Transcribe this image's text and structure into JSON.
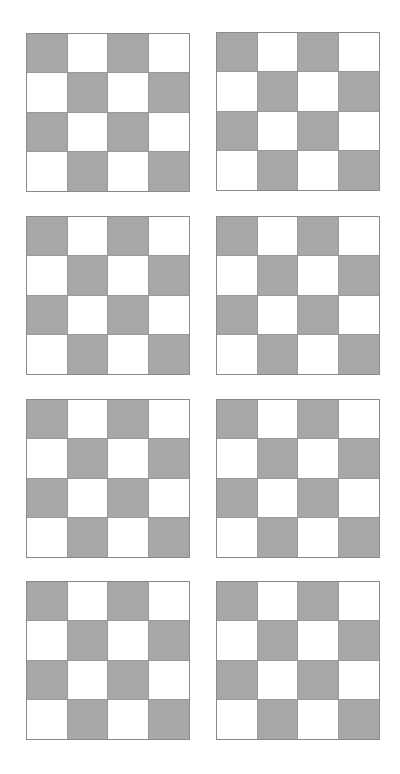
{
  "figure": {
    "colors": {
      "dark_cell": "#a7a7a7",
      "light_cell": "#ffffff",
      "grid_line": "#8a8a8a",
      "background": "#ffffff"
    },
    "grid_size": {
      "rows": 4,
      "cols": 4
    },
    "pattern": [
      [
        "dark",
        "light",
        "dark",
        "light"
      ],
      [
        "light",
        "dark",
        "light",
        "dark"
      ],
      [
        "dark",
        "light",
        "dark",
        "light"
      ],
      [
        "light",
        "dark",
        "light",
        "dark"
      ]
    ],
    "boards": [
      {
        "id": "board-1",
        "x": 26,
        "y": 33
      },
      {
        "id": "board-2",
        "x": 216,
        "y": 32
      },
      {
        "id": "board-3",
        "x": 26,
        "y": 216
      },
      {
        "id": "board-4",
        "x": 216,
        "y": 216
      },
      {
        "id": "board-5",
        "x": 26,
        "y": 399
      },
      {
        "id": "board-6",
        "x": 216,
        "y": 399
      },
      {
        "id": "board-7",
        "x": 26,
        "y": 581
      },
      {
        "id": "board-8",
        "x": 216,
        "y": 581
      }
    ]
  }
}
